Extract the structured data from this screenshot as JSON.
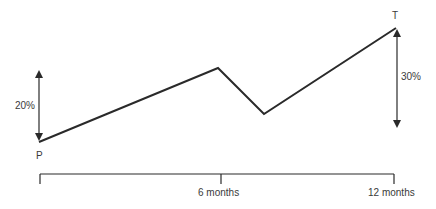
{
  "diagram": {
    "points": {
      "start_label": "P",
      "end_label": "T"
    },
    "annotations": {
      "left_arrow_label": "20%",
      "right_arrow_label": "30%"
    },
    "time_axis": {
      "ticks": [
        "6 months",
        "12 months"
      ]
    },
    "path": [
      {
        "x": 0,
        "y": 0,
        "label": "P"
      },
      {
        "x": 6,
        "y": 1.0
      },
      {
        "x": 7.5,
        "y": 0.45
      },
      {
        "x": 12,
        "y": 1.5,
        "label": "T"
      }
    ],
    "colors": {
      "line": "#2a2a2a",
      "text": "#3a3a3a"
    }
  }
}
